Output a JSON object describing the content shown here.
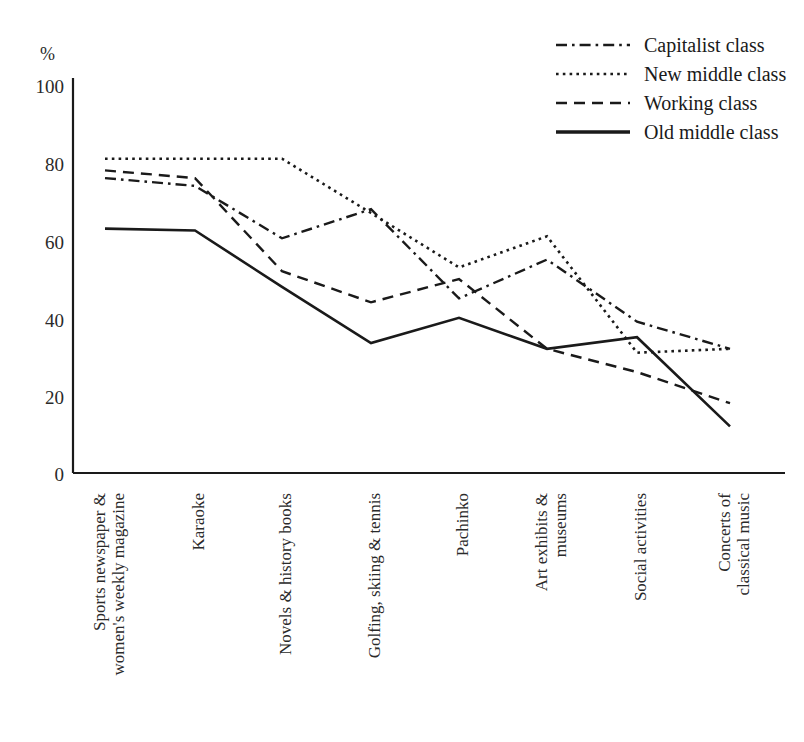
{
  "chart_data": {
    "type": "line",
    "title": "",
    "xlabel": "",
    "ylabel": "%",
    "ylim": [
      0,
      100
    ],
    "yticks": [
      0,
      20,
      40,
      60,
      80,
      100
    ],
    "ytick_labels": [
      "0",
      "20",
      "40",
      "60",
      "80",
      "100"
    ],
    "grid": false,
    "legend_position": "top-right",
    "categories": [
      "Sports newspaper &\nwomen's weekly magazine",
      "Karaoke",
      "Novels & history books",
      "Golfing, skiing & tennis",
      "Pachinko",
      "Art exhibits &\nmuseums",
      "Social activities",
      "Concerts of\nclassical music"
    ],
    "series": [
      {
        "name": "Capitalist class",
        "style": "dash-dot",
        "values": [
          76,
          74,
          60.5,
          68,
          45,
          55,
          39,
          32
        ]
      },
      {
        "name": "New middle class",
        "style": "dotted",
        "values": [
          81,
          81,
          81,
          67,
          53,
          61,
          31,
          32
        ]
      },
      {
        "name": "Working class",
        "style": "dashed",
        "values": [
          78,
          76,
          52,
          44,
          50,
          32,
          26,
          18
        ]
      },
      {
        "name": "Old middle class",
        "style": "solid",
        "values": [
          63,
          62.5,
          48,
          33.5,
          40,
          32,
          35,
          12
        ]
      }
    ]
  },
  "axis": {
    "y_unit_label": "%",
    "tick_0": "0",
    "tick_20": "20",
    "tick_40": "40",
    "tick_60": "60",
    "tick_80": "80",
    "tick_100": "100"
  },
  "categories_display": [
    {
      "line1": "Sports newspaper &",
      "line2": "women's weekly magazine"
    },
    {
      "line1": "Karaoke",
      "line2": ""
    },
    {
      "line1": "Novels & history books",
      "line2": ""
    },
    {
      "line1": "Golfing, skiing & tennis",
      "line2": ""
    },
    {
      "line1": "Pachinko",
      "line2": ""
    },
    {
      "line1": "Art exhibits &",
      "line2": "museums"
    },
    {
      "line1": "Social activities",
      "line2": ""
    },
    {
      "line1": "Concerts of",
      "line2": "classical music"
    }
  ],
  "legend": {
    "items": [
      {
        "label": "Capitalist class",
        "style": "dash-dot"
      },
      {
        "label": "New middle class",
        "style": "dotted"
      },
      {
        "label": "Working class",
        "style": "dashed"
      },
      {
        "label": "Old middle class",
        "style": "solid"
      }
    ]
  },
  "colors": {
    "line": "#1a1a1a",
    "text": "#2a2a2a",
    "background": "#ffffff"
  }
}
